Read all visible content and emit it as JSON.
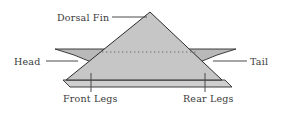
{
  "figure": {
    "kind": "labelled-anatomy-diagram",
    "background_color": "#ffffff",
    "body_fill": "#c6c6c6",
    "wing_fill": "#b9b9b9",
    "plank_fill": "#cfcfcf",
    "outline_color": "#2b2b2b",
    "dotted_line_color": "#6d6d6d",
    "leader_color": "#4a4a4a",
    "text_color": "#3a3a3a"
  },
  "labels": {
    "dorsal_fin": "Dorsal Fin",
    "head": "Head",
    "tail": "Tail",
    "front_legs": "Front Legs",
    "rear_legs": "Rear Legs"
  },
  "geometry": {
    "apex": [
      150,
      12
    ],
    "base_left": [
      66,
      79
    ],
    "base_right": [
      222,
      79
    ],
    "dotted_line_y": 52,
    "plank_top_y": 79,
    "plank_bottom_y": 87,
    "front_leg_tick_x": 91,
    "rear_leg_tick_x": 205,
    "left_wing_tip_x": 55,
    "right_wing_tip_x": 236
  }
}
